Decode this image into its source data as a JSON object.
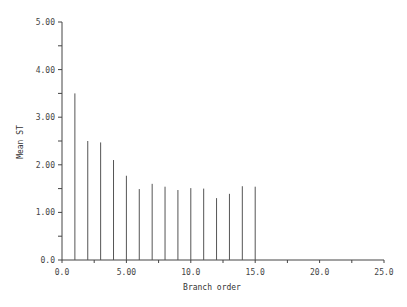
{
  "chart_data": {
    "type": "bar",
    "title": "",
    "xlabel": "Branch order",
    "ylabel": "Mean ST",
    "x": [
      1,
      2,
      3,
      4,
      5,
      6,
      7,
      8,
      9,
      10,
      11,
      12,
      13,
      14,
      15
    ],
    "values": [
      3.5,
      2.5,
      2.47,
      2.1,
      1.77,
      1.49,
      1.6,
      1.54,
      1.47,
      1.51,
      1.5,
      1.3,
      1.39,
      1.55,
      1.54
    ],
    "xlim": [
      0,
      25
    ],
    "ylim": [
      0,
      5
    ],
    "x_ticks": [
      0,
      2.5,
      5,
      7.5,
      10,
      12.5,
      15,
      17.5,
      20,
      22.5,
      25
    ],
    "x_tick_labels": [
      {
        "value": 0,
        "label": "0.0"
      },
      {
        "value": 5,
        "label": "5.00"
      },
      {
        "value": 10,
        "label": "10.0"
      },
      {
        "value": 15,
        "label": "15.0"
      },
      {
        "value": 20,
        "label": "20.0"
      },
      {
        "value": 25,
        "label": "25.0"
      }
    ],
    "y_ticks": [
      0,
      0.5,
      1,
      1.5,
      2,
      2.5,
      3,
      3.5,
      4,
      4.5,
      5
    ],
    "y_tick_labels": [
      {
        "value": 0,
        "label": "0.0"
      },
      {
        "value": 1,
        "label": "1.00"
      },
      {
        "value": 2,
        "label": "2.00"
      },
      {
        "value": 3,
        "label": "3.00"
      },
      {
        "value": 4,
        "label": "4.00"
      },
      {
        "value": 5,
        "label": "5.00"
      }
    ],
    "grid": false,
    "legend": null,
    "style": "vertical line spikes"
  },
  "colors": {
    "line": "#555555",
    "axis": "#444444",
    "text": "#444444",
    "background": "#ffffff"
  }
}
